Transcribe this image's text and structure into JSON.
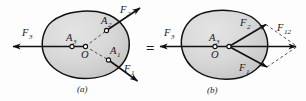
{
  "figure": {
    "equals_sign": "=",
    "background_color": "#fdfdfd",
    "body_fill_color": "#d6d6d6",
    "outline_color": "#111111"
  },
  "panel_a": {
    "caption": "(a)",
    "body_label": "rigid-body-outline",
    "points": [
      {
        "id": "A1",
        "label": "A",
        "subscript": "1"
      },
      {
        "id": "A2",
        "label": "A",
        "subscript": "2"
      },
      {
        "id": "A3",
        "label": "A",
        "subscript": "3"
      },
      {
        "id": "O",
        "label": "O",
        "subscript": ""
      }
    ],
    "forces": [
      {
        "id": "F1",
        "label": "F",
        "subscript": "1",
        "direction": "down-right",
        "applied_at": "A1"
      },
      {
        "id": "F2",
        "label": "F",
        "subscript": "2",
        "direction": "up-right",
        "applied_at": "A2"
      },
      {
        "id": "F3",
        "label": "F",
        "subscript": "3",
        "direction": "left",
        "applied_at": "A3"
      }
    ]
  },
  "panel_b": {
    "caption": "(b)",
    "body_label": "rigid-body-outline",
    "points": [
      {
        "id": "A3",
        "label": "A",
        "subscript": "3"
      },
      {
        "id": "O",
        "label": "O",
        "subscript": ""
      }
    ],
    "forces": [
      {
        "id": "F1",
        "label": "F",
        "subscript": "1",
        "direction": "down-right",
        "applied_at": "O"
      },
      {
        "id": "F2",
        "label": "F",
        "subscript": "2",
        "direction": "up-right",
        "applied_at": "O"
      },
      {
        "id": "F3",
        "label": "F",
        "subscript": "3",
        "direction": "left",
        "applied_at": "O"
      },
      {
        "id": "F12",
        "label": "F",
        "subscript": "12",
        "direction": "right",
        "applied_at": "O",
        "is_resultant": true
      }
    ],
    "construction": "parallelogram-dashed-lines"
  }
}
